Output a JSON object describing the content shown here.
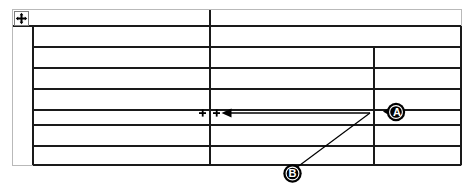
{
  "document": {
    "type": "word-table-screenshot",
    "description": "Empty Microsoft Word table with column resize annotation",
    "background_color": "#ffffff",
    "page_border_color": "#b9b9b9",
    "table_line_color": "#000000",
    "annotation_color": "#000000"
  },
  "table": {
    "move_handle": {
      "icon": "move-cross-icon",
      "tooltip": "Move table",
      "x": 14,
      "y": 11,
      "size": 15
    },
    "outer": {
      "x": 12,
      "y": 9,
      "width": 450,
      "height": 157
    },
    "body": {
      "left": 33,
      "right": 461,
      "top": 26,
      "bottom": 165
    },
    "row_lines_y": [
      26,
      47,
      68,
      89,
      110,
      125,
      146,
      165
    ],
    "row_count": 7,
    "column_dividers": [
      {
        "name": "column-divider-main",
        "x": 210,
        "top": 10,
        "bottom": 165,
        "weight": 2
      },
      {
        "name": "column-divider-right",
        "x": 374,
        "top": 47,
        "bottom": 165,
        "weight": 1
      }
    ],
    "first_row_full_width": true
  },
  "annotations": {
    "resize_arrow": {
      "name": "column-width-arrow",
      "direction": "left",
      "from_x": 370,
      "to_x": 222,
      "y": 113,
      "head": "solid-triangle"
    },
    "column_markers": {
      "name": "column-boundary-ticks",
      "glyphs": [
        "+",
        "+"
      ],
      "left_x": 202,
      "right_x": 216,
      "y": 113
    },
    "leader_line_b": {
      "name": "callout-b-leader-line",
      "from": {
        "x": 296,
        "y": 168
      },
      "to": {
        "x": 370,
        "y": 113
      }
    }
  },
  "callouts": [
    {
      "id": "callout-a",
      "label": "A",
      "shape": "speech-bubble",
      "tail_direction": "left",
      "x": 383,
      "y": 102,
      "points_to": "column-divider-right"
    },
    {
      "id": "callout-b",
      "label": "B",
      "shape": "circle",
      "x": 283,
      "y": 164,
      "points_to": "column-width-arrow"
    }
  ]
}
